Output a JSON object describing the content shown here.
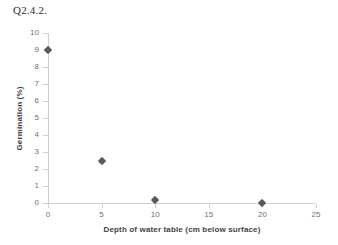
{
  "caption": "Q2.4.2.",
  "chart_data": {
    "type": "scatter",
    "title": "",
    "xlabel": "Depth of water table (cm below surface)",
    "ylabel": "Germination (%)",
    "xlim": [
      0,
      25
    ],
    "ylim": [
      0,
      10
    ],
    "xticks": [
      0,
      5,
      10,
      15,
      20,
      25
    ],
    "yticks": [
      0,
      1,
      2,
      3,
      4,
      5,
      6,
      7,
      8,
      9,
      10
    ],
    "grid": false,
    "legend": false,
    "marker": "diamond",
    "marker_color": "#595959",
    "axis_color": "#d0d0d0",
    "tick_label_color": "#6f6f6f",
    "axis_title_color": "#3f3f3f",
    "x": [
      0,
      5,
      10,
      20
    ],
    "y": [
      9.0,
      2.5,
      0.15,
      0.0
    ],
    "points": [
      {
        "x": 0,
        "y": 9.0
      },
      {
        "x": 5,
        "y": 2.5
      },
      {
        "x": 10,
        "y": 0.15
      },
      {
        "x": 20,
        "y": 0.0
      }
    ]
  }
}
